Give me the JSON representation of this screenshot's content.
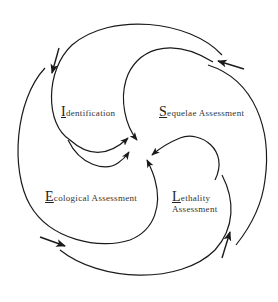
{
  "diagram": {
    "type": "four-part spiral cycle",
    "stroke_color": "#1a1a1a",
    "text_color": "#333333",
    "labels": [
      {
        "initial": "I",
        "rest": "dentification",
        "full": "Identification"
      },
      {
        "initial": "S",
        "rest": "equelae Assessment",
        "full": "Sequelae Assessment"
      },
      {
        "initial": "E",
        "rest": "cological  Assessment",
        "full": "Ecological Assessment"
      },
      {
        "initial": "L",
        "rest": "ethality",
        "line2": "Assessment",
        "full": "Lethality Assessment"
      }
    ],
    "arrows": {
      "spirals": 4,
      "input_arrows": 4,
      "center_point": "converging arrows toward center"
    }
  }
}
